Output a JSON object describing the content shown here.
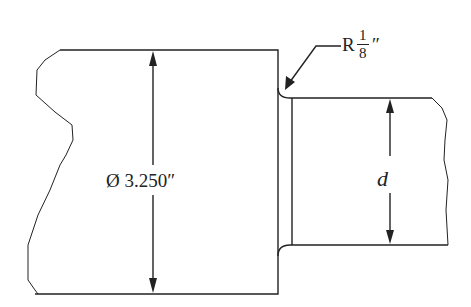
{
  "diagram": {
    "labels": {
      "large_diameter": "Ø 3.250″",
      "small_diameter_var": "d",
      "fillet_prefix": "R",
      "fillet_num": "1",
      "fillet_den": "8",
      "fillet_unit": "″"
    },
    "colors": {
      "line": "#222222",
      "background": "#ffffff"
    }
  }
}
